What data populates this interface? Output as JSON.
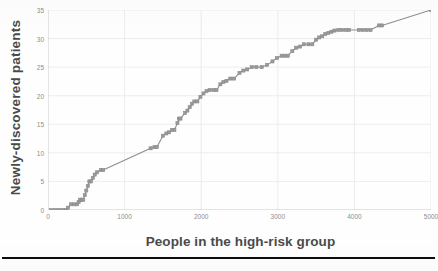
{
  "chart_data": {
    "type": "line",
    "title": "",
    "subtitle": "",
    "xlabel": "People in the high-risk group",
    "ylabel": "Newly-discovered patients",
    "xlim": [
      0,
      5000
    ],
    "ylim": [
      0,
      35
    ],
    "x_ticks": [
      0,
      1000,
      2000,
      3000,
      4000,
      5000
    ],
    "y_ticks": [
      0,
      5,
      10,
      15,
      20,
      25,
      30,
      35
    ],
    "x_tick_labels": [
      "0",
      "1000",
      "2000",
      "3000",
      "4000",
      "5000"
    ],
    "y_tick_labels": [
      "0",
      "5",
      "10",
      "15",
      "20",
      "25",
      "30",
      "35"
    ],
    "grid": "horizontal-and-vertical-faint",
    "legend": "none",
    "annotations": [],
    "series": [
      {
        "name": "Cumulative newly-discovered patients",
        "color": "#8e8e8e",
        "marker": "square",
        "marker_color": "#8a8a8a",
        "line_width": 1.1,
        "points": [
          [
            40,
            0
          ],
          [
            90,
            0
          ],
          [
            140,
            0
          ],
          [
            190,
            0
          ],
          [
            235,
            0
          ],
          [
            260,
            0.4
          ],
          [
            300,
            1
          ],
          [
            340,
            1
          ],
          [
            380,
            1
          ],
          [
            400,
            1.4
          ],
          [
            420,
            1.8
          ],
          [
            440,
            1.8
          ],
          [
            460,
            1.8
          ],
          [
            480,
            2.6
          ],
          [
            500,
            3.4
          ],
          [
            520,
            4.2
          ],
          [
            540,
            5
          ],
          [
            560,
            5
          ],
          [
            585,
            5.6
          ],
          [
            610,
            6.2
          ],
          [
            640,
            6.6
          ],
          [
            690,
            7
          ],
          [
            720,
            7
          ],
          [
            1340,
            10.8
          ],
          [
            1390,
            11
          ],
          [
            1420,
            11
          ],
          [
            1500,
            13
          ],
          [
            1545,
            13.4
          ],
          [
            1580,
            13.6
          ],
          [
            1620,
            14
          ],
          [
            1650,
            14
          ],
          [
            1690,
            15.2
          ],
          [
            1710,
            16
          ],
          [
            1730,
            16
          ],
          [
            1790,
            17
          ],
          [
            1820,
            17.4
          ],
          [
            1850,
            18
          ],
          [
            1880,
            18.6
          ],
          [
            1910,
            19
          ],
          [
            1950,
            19
          ],
          [
            1990,
            19.8
          ],
          [
            2030,
            20.4
          ],
          [
            2070,
            20.8
          ],
          [
            2110,
            21
          ],
          [
            2160,
            21
          ],
          [
            2200,
            21
          ],
          [
            2250,
            22
          ],
          [
            2290,
            22.4
          ],
          [
            2330,
            22.6
          ],
          [
            2380,
            23
          ],
          [
            2430,
            23
          ],
          [
            2500,
            24
          ],
          [
            2550,
            24.4
          ],
          [
            2600,
            24.6
          ],
          [
            2660,
            25
          ],
          [
            2720,
            25
          ],
          [
            2790,
            25
          ],
          [
            2860,
            25.4
          ],
          [
            2930,
            26
          ],
          [
            2990,
            26.6
          ],
          [
            3050,
            27
          ],
          [
            3090,
            27
          ],
          [
            3130,
            27
          ],
          [
            3190,
            27.8
          ],
          [
            3240,
            28.4
          ],
          [
            3290,
            28.6
          ],
          [
            3340,
            29
          ],
          [
            3400,
            29
          ],
          [
            3450,
            29
          ],
          [
            3500,
            29.8
          ],
          [
            3540,
            30.2
          ],
          [
            3580,
            30.4
          ],
          [
            3620,
            30.8
          ],
          [
            3660,
            31
          ],
          [
            3700,
            31.2
          ],
          [
            3740,
            31.4
          ],
          [
            3790,
            31.5
          ],
          [
            3840,
            31.5
          ],
          [
            3890,
            31.5
          ],
          [
            3930,
            31.5
          ],
          [
            4060,
            31.5
          ],
          [
            4110,
            31.5
          ],
          [
            4160,
            31.5
          ],
          [
            4210,
            31.5
          ],
          [
            4320,
            32.3
          ],
          [
            4360,
            32.3
          ],
          [
            5000,
            35
          ]
        ]
      }
    ]
  },
  "axis": {
    "y_title": "Newly-discovered  patients",
    "x_title": "People in the high-risk group"
  },
  "footer": {
    "caption": ""
  },
  "colors": {
    "series": "#8e8e8e",
    "grid": "#e9e9e9",
    "axis": "#c9c9c9",
    "tick_text": "#8d8d8d",
    "title_text": "#4a4a4a",
    "rule": "#0d0d0d"
  }
}
